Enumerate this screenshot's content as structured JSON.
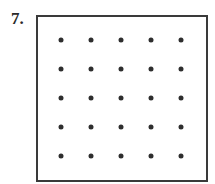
{
  "problem": {
    "number_label": "7.",
    "grid": {
      "rows": 5,
      "cols": 5,
      "dot_color": "#2e2e2e",
      "border_color": "#3a3a3a"
    }
  }
}
